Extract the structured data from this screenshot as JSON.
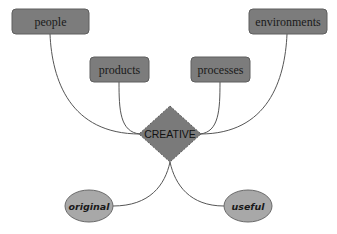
{
  "diagram": {
    "center": {
      "label": "CREATIVE",
      "shape": "diamond",
      "fill": "#7a7a7a",
      "stroke": "#5a5a5a"
    },
    "inputs": [
      {
        "label": "people",
        "shape": "rounded-rect"
      },
      {
        "label": "products",
        "shape": "rounded-rect"
      },
      {
        "label": "processes",
        "shape": "rounded-rect"
      },
      {
        "label": "environments",
        "shape": "rounded-rect"
      }
    ],
    "outputs": [
      {
        "label": "original",
        "shape": "ellipse"
      },
      {
        "label": "useful",
        "shape": "ellipse"
      }
    ],
    "colors": {
      "box_fill": "#7c7c7c",
      "box_stroke": "#5e5e5e",
      "ellipse_fill": "#a8a8a8",
      "ellipse_stroke": "#6a6a6a",
      "edge": "#555555"
    }
  }
}
